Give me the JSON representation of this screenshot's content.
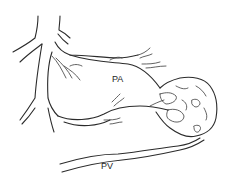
{
  "diagram": {
    "labels": {
      "pa": "PA",
      "pv": "PV"
    },
    "colors": {
      "background": "#ffffff",
      "ink": "#2b2b2b"
    }
  }
}
